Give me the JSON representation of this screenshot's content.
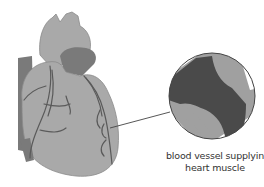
{
  "diagram": {
    "subject": "heart",
    "inset": {
      "shape": "circle",
      "content": "narrowed blood vessel"
    },
    "caption": {
      "line1": "blood vessel supplying",
      "line2": "heart muscle"
    },
    "colors": {
      "heart_fill": "#a9a9a9",
      "heart_shadow": "#7a7a7a",
      "vessel_lines": "#5a5a5a",
      "vessel_wall": "#a0a0a0",
      "plaque": "#4a4a4a",
      "outline": "#444444",
      "background": "#ffffff"
    }
  }
}
